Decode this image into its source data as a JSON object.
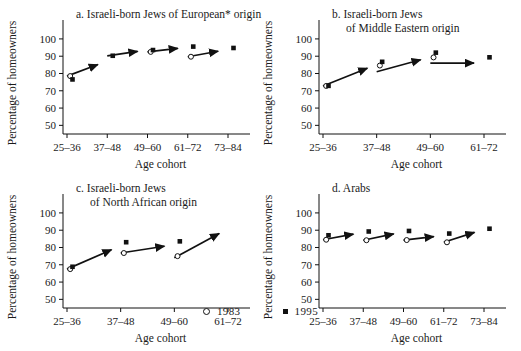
{
  "figure": {
    "axis_y_label": "Percentage of homeowners",
    "axis_x_label": "Age cohort",
    "y_ticks": [
      50,
      60,
      70,
      80,
      90,
      100
    ],
    "y_tick_labels": [
      "50",
      "60",
      "70",
      "80",
      "90",
      "100"
    ],
    "ylim": [
      45,
      104
    ]
  },
  "legend": {
    "position": "bottom-center",
    "entries": [
      {
        "label": "1983",
        "marker": "open-circle"
      },
      {
        "label": "1995",
        "marker": "filled-square"
      }
    ]
  },
  "chart_data": [
    {
      "type": "scatter",
      "panel": "a",
      "title": "a. Israeli-born Jews of European* origin",
      "title_lines": [
        "a. Israeli-born Jews of European* origin"
      ],
      "xlabel": "Age cohort",
      "ylabel": "Percentage of homeowners",
      "ylim": [
        45,
        104
      ],
      "grid": false,
      "categories": [
        "25–36",
        "37–48",
        "49–60",
        "61–72",
        "73–84"
      ],
      "series": [
        {
          "name": "1983",
          "marker": "open-circle",
          "values": [
            78.5,
            null,
            92.5,
            89.7,
            null
          ]
        },
        {
          "name": "1995",
          "marker": "filled-square",
          "values": [
            76.5,
            90.2,
            93.5,
            95.5,
            94.7
          ]
        }
      ],
      "cohort_arrows": [
        {
          "from": "25–36",
          "from_value": 78.5,
          "to": "37–48",
          "to_value": 87.2
        },
        {
          "from": "37–48",
          "from_value": 90.2,
          "to": "49–60",
          "to_value": 93.6
        },
        {
          "from": "49–60",
          "from_value": 92.5,
          "to": "61–72",
          "to_value": 95.2
        },
        {
          "from": "61–72",
          "from_value": 89.7,
          "to": "73–84",
          "to_value": 93.9
        }
      ]
    },
    {
      "type": "scatter",
      "panel": "b",
      "title": "b. Israeli-born Jews of Middle Eastern origin",
      "title_lines": [
        "b. Israeli-born Jews",
        "of Middle Eastern origin"
      ],
      "xlabel": "Age cohort",
      "ylabel": "Percentage of homeowners",
      "ylim": [
        45,
        104
      ],
      "grid": false,
      "categories": [
        "25–36",
        "37–48",
        "49–60",
        "61–72"
      ],
      "series": [
        {
          "name": "1983",
          "marker": "open-circle",
          "values": [
            72.8,
            84.6,
            89.3,
            null
          ]
        },
        {
          "name": "1995",
          "marker": "filled-square",
          "values": [
            72.8,
            86.7,
            92.0,
            89.3
          ]
        }
      ],
      "cohort_arrows": [
        {
          "from": "25–36",
          "from_value": 72.8,
          "to": "37–48",
          "to_value": 85.2
        },
        {
          "from": "37–48",
          "from_value": 81.0,
          "to": "49–60",
          "to_value": 89.5
        },
        {
          "from": "49–60",
          "from_value": 86.0,
          "to": "61–72",
          "to_value": 86.0
        }
      ]
    },
    {
      "type": "scatter",
      "panel": "c",
      "title": "c. Israeli-born Jews of North African origin",
      "title_lines": [
        "c. Israeli-born Jews",
        "of North African origin"
      ],
      "xlabel": "Age cohort",
      "ylabel": "Percentage of homeowners",
      "ylim": [
        45,
        104
      ],
      "grid": false,
      "categories": [
        "25–36",
        "37–48",
        "49–60",
        "61–72"
      ],
      "series": [
        {
          "name": "1983",
          "marker": "open-circle",
          "values": [
            67.5,
            76.8,
            75.0,
            null
          ]
        },
        {
          "name": "1995",
          "marker": "filled-square",
          "values": [
            68.8,
            83.0,
            83.5,
            null
          ]
        }
      ],
      "cohort_arrows": [
        {
          "from": "25–36",
          "from_value": 67.5,
          "to": "37–48",
          "to_value": 81.0
        },
        {
          "from": "37–48",
          "from_value": 76.8,
          "to": "49–60",
          "to_value": 81.6
        },
        {
          "from": "49–60",
          "from_value": 74.0,
          "to": "61–72",
          "to_value": 90.8
        }
      ]
    },
    {
      "type": "scatter",
      "panel": "d",
      "title": "d. Arabs",
      "title_lines": [
        "d. Arabs"
      ],
      "xlabel": "Age cohort",
      "ylabel": "Percentage of homeowners",
      "ylim": [
        45,
        104
      ],
      "grid": false,
      "categories": [
        "25–36",
        "37–48",
        "49–60",
        "61–72",
        "73–84"
      ],
      "series": [
        {
          "name": "1983",
          "marker": "open-circle",
          "values": [
            84.5,
            84.2,
            84.3,
            83.0,
            null
          ]
        },
        {
          "name": "1995",
          "marker": "filled-square",
          "values": [
            87.0,
            89.2,
            89.5,
            88.0,
            90.8
          ]
        }
      ],
      "cohort_arrows": [
        {
          "from": "25–36",
          "from_value": 84.5,
          "to": "37–48",
          "to_value": 88.8
        },
        {
          "from": "37–48",
          "from_value": 84.2,
          "to": "49–60",
          "to_value": 89.0
        },
        {
          "from": "49–60",
          "from_value": 84.3,
          "to": "61–72",
          "to_value": 87.0
        },
        {
          "from": "61–72",
          "from_value": 83.0,
          "to": "73–84",
          "to_value": 90.5
        }
      ]
    }
  ]
}
